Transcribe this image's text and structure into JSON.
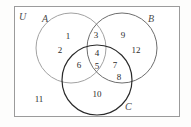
{
  "diagram": {
    "title_label": "U",
    "universe_label": "U",
    "sets": [
      {
        "id": "A",
        "label": "A",
        "stroke": "#9a9a9a",
        "cx": 71,
        "cy": 48,
        "r": 35
      },
      {
        "id": "B",
        "label": "B",
        "stroke": "#6e6e6e",
        "cx": 122,
        "cy": 48,
        "r": 35
      },
      {
        "id": "C",
        "label": "C",
        "stroke": "#262626",
        "cx": 97,
        "cy": 80,
        "r": 35
      }
    ],
    "regions": [
      {
        "name": "A-only",
        "elements": [
          "1",
          "2"
        ]
      },
      {
        "name": "A-and-B-only",
        "elements": [
          "3"
        ]
      },
      {
        "name": "B-only",
        "elements": [
          "9",
          "12"
        ]
      },
      {
        "name": "A-and-C-only",
        "elements": [
          "6"
        ]
      },
      {
        "name": "A-B-C",
        "elements": [
          "4",
          "5"
        ]
      },
      {
        "name": "B-and-C-only",
        "elements": [
          "7",
          "8"
        ]
      },
      {
        "name": "C-only",
        "elements": [
          "10"
        ]
      },
      {
        "name": "outside",
        "elements": [
          "11"
        ]
      }
    ],
    "elements": {
      "e1": "1",
      "e2": "2",
      "e3": "3",
      "e4": "4",
      "e5": "5",
      "e6": "6",
      "e7": "7",
      "e8": "8",
      "e9": "9",
      "e10": "10",
      "e11": "11",
      "e12": "12"
    },
    "labels": {
      "U": "U",
      "A": "A",
      "B": "B",
      "C": "C"
    }
  }
}
